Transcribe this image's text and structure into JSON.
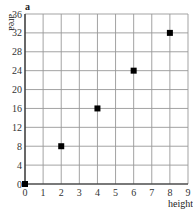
{
  "chart_data": {
    "type": "scatter",
    "panel_label": "a",
    "title": "",
    "xlabel": "height",
    "ylabel": "area",
    "x": [
      0,
      2,
      4,
      6,
      8
    ],
    "y": [
      0,
      8,
      16,
      24,
      32
    ],
    "xlim": [
      0,
      9
    ],
    "ylim": [
      0,
      36
    ],
    "xticks": [
      0,
      1,
      2,
      3,
      4,
      5,
      6,
      7,
      8,
      9
    ],
    "yticks": [
      0,
      4,
      8,
      12,
      16,
      20,
      24,
      28,
      32,
      36
    ],
    "grid": true,
    "legend": null,
    "marker": "square",
    "marker_color": "#000000",
    "grid_color": "#999999"
  }
}
